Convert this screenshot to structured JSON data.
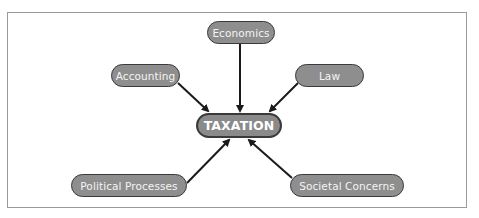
{
  "diagram": {
    "type": "concept-map",
    "center": {
      "label": "TAXATION"
    },
    "nodes": [
      {
        "id": "economics",
        "label": "Economics"
      },
      {
        "id": "accounting",
        "label": "Accounting"
      },
      {
        "id": "law",
        "label": "Law"
      },
      {
        "id": "political",
        "label": "Political Processes"
      },
      {
        "id": "societal",
        "label": "Societal Concerns"
      }
    ],
    "edges": [
      {
        "from": "economics",
        "to": "center"
      },
      {
        "from": "accounting",
        "to": "center"
      },
      {
        "from": "law",
        "to": "center"
      },
      {
        "from": "political",
        "to": "center"
      },
      {
        "from": "societal",
        "to": "center"
      }
    ],
    "colors": {
      "node_fill": "#8e8e8e",
      "node_border": "#3a3a3a",
      "arrow": "#1a1a1a",
      "frame": "#9a9a9a"
    }
  }
}
